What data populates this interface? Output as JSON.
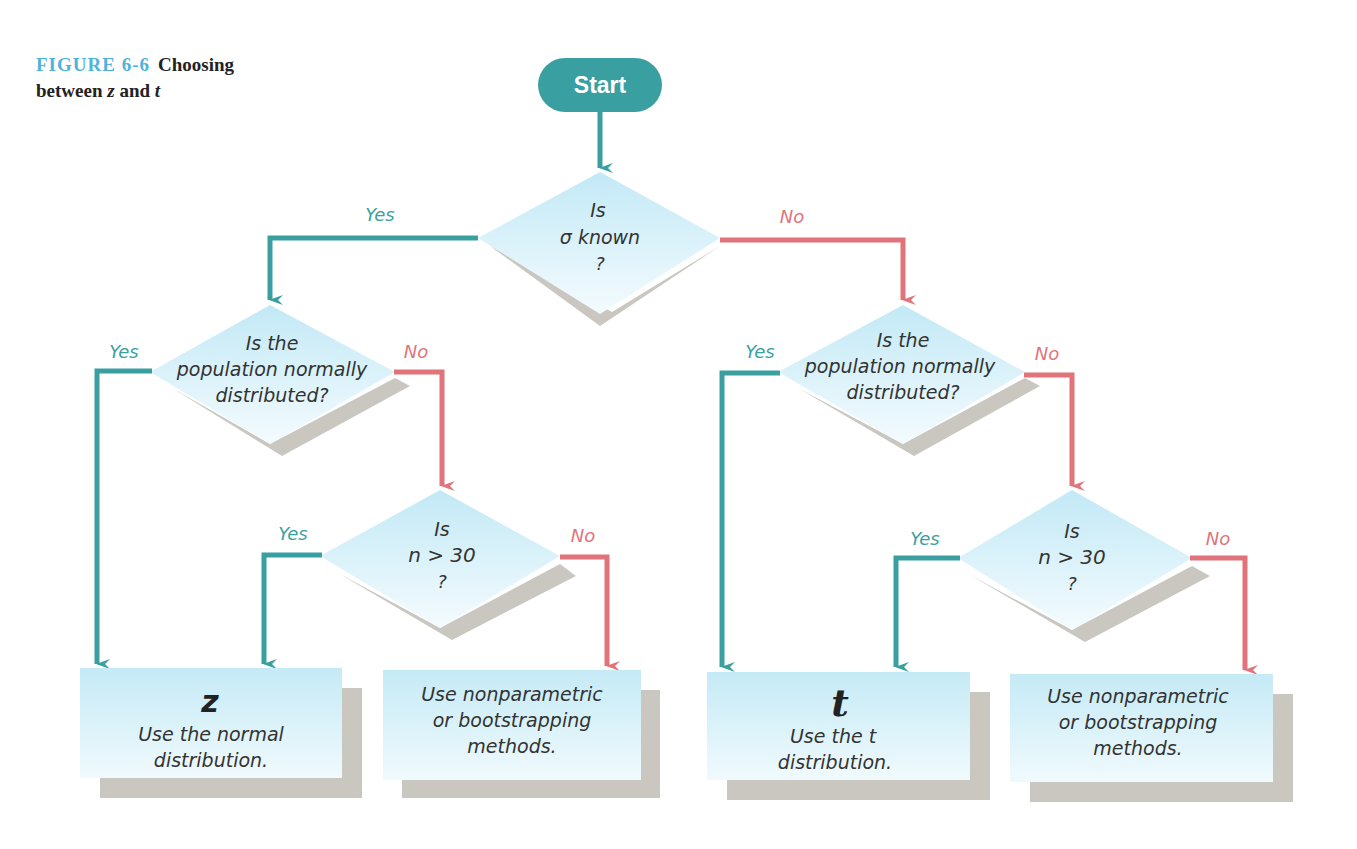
{
  "caption": {
    "figure_label": "FIGURE 6-6",
    "title_part1": "Choosing",
    "title_part2": "between",
    "var_z": "z",
    "and": "and",
    "var_t": "t"
  },
  "colors": {
    "teal": "#3a9fa0",
    "red": "#e0747a",
    "box_fill_top": "#c8ebf6",
    "box_fill_bottom": "#eef9fd",
    "shadow": "#c9c7c0",
    "text": "#333333",
    "caption_accent": "#4fb3d9"
  },
  "start": {
    "label": "Start"
  },
  "decisions": {
    "sigma": {
      "line1": "Is",
      "line2": "σ known",
      "line3": "?"
    },
    "normal_left": {
      "line1": "Is the",
      "line2": "population normally",
      "line3": "distributed?"
    },
    "n_left": {
      "line1": "Is",
      "line2": "n > 30",
      "line3": "?"
    },
    "normal_right": {
      "line1": "Is the",
      "line2": "population normally",
      "line3": "distributed?"
    },
    "n_right": {
      "line1": "Is",
      "line2": "n > 30",
      "line3": "?"
    }
  },
  "branch_labels": {
    "yes": "Yes",
    "no": "No"
  },
  "outcomes": {
    "z_box": {
      "symbol": "z",
      "line1": "Use the normal",
      "line2": "distribution."
    },
    "nonparam_left": {
      "line1": "Use nonparametric",
      "line2": "or bootstrapping",
      "line3": "methods."
    },
    "t_box": {
      "symbol": "t",
      "line1": "Use the t",
      "line2": "distribution."
    },
    "nonparam_right": {
      "line1": "Use nonparametric",
      "line2": "or bootstrapping",
      "line3": "methods."
    }
  }
}
